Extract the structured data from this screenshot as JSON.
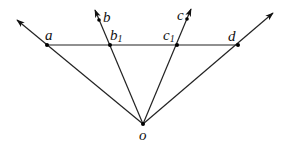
{
  "diagram": {
    "title": "",
    "origin": {
      "label": "o",
      "x": 143,
      "y": 124
    },
    "horizontal_line": {
      "from": "a",
      "to": "d",
      "y": 45
    },
    "points": [
      {
        "id": "a",
        "label": "a",
        "subscript": "",
        "x": 47,
        "y": 45
      },
      {
        "id": "b1",
        "label": "b",
        "subscript": "1",
        "x": 110,
        "y": 45
      },
      {
        "id": "c1",
        "label": "c",
        "subscript": "1",
        "x": 177,
        "y": 45
      },
      {
        "id": "d",
        "label": "d",
        "subscript": "",
        "x": 238,
        "y": 45
      }
    ],
    "rays": [
      {
        "id": "ray-oa",
        "from": "o",
        "through": "a",
        "end": [
          17,
          20
        ],
        "end_label": ""
      },
      {
        "id": "ray-ob",
        "from": "o",
        "through": "b1",
        "end": [
          95,
          10
        ],
        "end_label": "b"
      },
      {
        "id": "ray-oc",
        "from": "o",
        "through": "c1",
        "end": [
          191,
          9
        ],
        "end_label": "c"
      },
      {
        "id": "ray-od",
        "from": "o",
        "through": "d",
        "end": [
          273,
          13
        ],
        "end_label": ""
      }
    ],
    "labels": {
      "a": "a",
      "b": "b",
      "b1_main": "b",
      "b1_sub": "1",
      "c": "c",
      "c1_main": "c",
      "c1_sub": "1",
      "d": "d",
      "o": "o"
    },
    "colors": {
      "stroke": "#222222",
      "point": "#000000",
      "background": "#ffffff"
    }
  }
}
